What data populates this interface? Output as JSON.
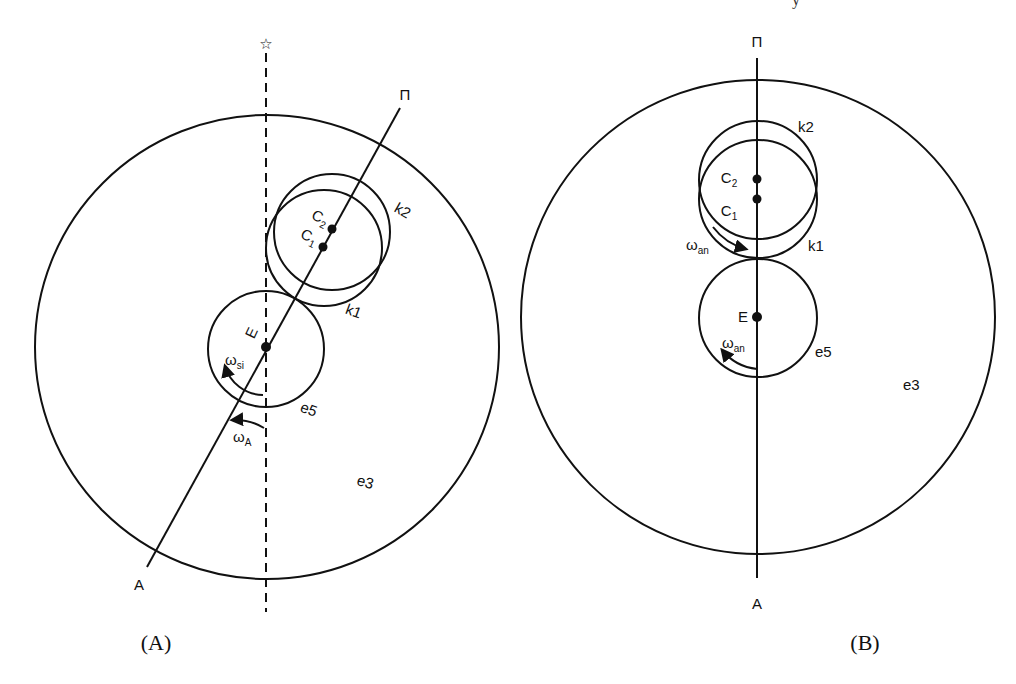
{
  "header_fragment": "y",
  "panels": [
    {
      "id": "A",
      "caption": "(A)",
      "axis_top_label": "Π",
      "axis_bottom_label": "A",
      "reference_top_label": "☆",
      "outer_circle_label": "e3",
      "inner_circle_label": "e5",
      "center_label": "E",
      "circle_k1_label": "k1",
      "circle_k2_label": "k2",
      "c1_label": "C",
      "c1_sub": "1",
      "c2_label": "C",
      "c2_sub": "2",
      "omega_si": {
        "symbol": "ω",
        "sub": "si"
      },
      "omega_A": {
        "symbol": "ω",
        "sub": "A"
      }
    },
    {
      "id": "B",
      "caption": "(B)",
      "axis_top_label": "Π",
      "axis_bottom_label": "A",
      "outer_circle_label": "e3",
      "inner_circle_label": "e5",
      "center_label": "E",
      "circle_k1_label": "k1",
      "circle_k2_label": "k2",
      "c1_label": "C",
      "c1_sub": "1",
      "c2_label": "C",
      "c2_sub": "2",
      "omega_upper": {
        "symbol": "ω",
        "sub": "an"
      },
      "omega_lower": {
        "symbol": "ω",
        "sub": "an"
      }
    }
  ],
  "colors": {
    "stroke": "#111111",
    "background": "#ffffff"
  }
}
